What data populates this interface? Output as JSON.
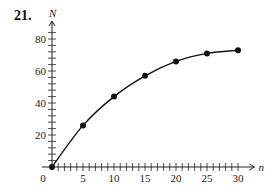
{
  "problem_number": "21.",
  "chart_data": {
    "type": "line",
    "title": "",
    "xlabel": "n",
    "ylabel": "N",
    "x": [
      0,
      5,
      10,
      15,
      20,
      25,
      30
    ],
    "series": [
      {
        "name": "N",
        "values": [
          0,
          26,
          44,
          57,
          66,
          71,
          73
        ]
      }
    ],
    "xticks": [
      0,
      5,
      10,
      15,
      20,
      25,
      30
    ],
    "yticks": [
      20,
      40,
      60,
      80
    ],
    "xlim": [
      0,
      32
    ],
    "ylim": [
      0,
      85
    ],
    "x_minor_step": 1,
    "y_minor_step": 4,
    "grid": false,
    "markers": "filled-circle",
    "line_color": "#111111"
  }
}
